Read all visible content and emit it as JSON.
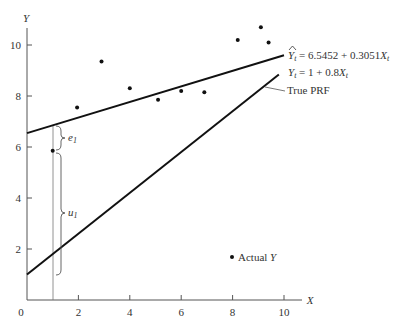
{
  "chart_data": {
    "type": "scatter",
    "title": "",
    "xlabel": "X",
    "ylabel": "Y",
    "xlim": [
      0,
      10.8
    ],
    "ylim": [
      0,
      11
    ],
    "x_ticks": [
      0,
      2,
      4,
      6,
      8,
      10
    ],
    "y_ticks": [
      2,
      4,
      6,
      8,
      10
    ],
    "x_tick_labels": [
      "0",
      "2",
      "4",
      "6",
      "8",
      "10"
    ],
    "y_tick_labels": [
      "2",
      "4",
      "6",
      "8",
      "10"
    ],
    "grid": false,
    "series": [
      {
        "name": "Actual Y",
        "kind": "scatter",
        "points": [
          {
            "x": 1.0,
            "y": 5.85
          },
          {
            "x": 1.95,
            "y": 7.55
          },
          {
            "x": 2.9,
            "y": 9.35
          },
          {
            "x": 4.0,
            "y": 8.3
          },
          {
            "x": 5.1,
            "y": 7.85
          },
          {
            "x": 6.0,
            "y": 8.2
          },
          {
            "x": 6.9,
            "y": 8.15
          },
          {
            "x": 8.2,
            "y": 10.2
          },
          {
            "x": 9.1,
            "y": 10.7
          },
          {
            "x": 9.4,
            "y": 10.1
          }
        ]
      },
      {
        "name": "SRF",
        "kind": "line",
        "intercept": 6.5452,
        "slope": 0.3051,
        "x_range": [
          0,
          10
        ],
        "label": "Ŷt = 6.5452 + 0.3051Xt"
      },
      {
        "name": "True PRF",
        "kind": "line",
        "intercept": 1,
        "slope": 0.8,
        "x_range": [
          0,
          9.8
        ],
        "label": "Yt = 1 + 0.8Xt"
      }
    ],
    "annotations": [
      {
        "text": "e1",
        "type": "brace",
        "x": 1,
        "from_y": 6.85,
        "to_y": 5.9
      },
      {
        "text": "u1",
        "type": "brace",
        "x": 1,
        "from_y": 5.8,
        "to_y": 1.8
      },
      {
        "text": "True PRF",
        "type": "pointer",
        "target_line": "True PRF"
      },
      {
        "text": "Actual Y",
        "type": "legend",
        "marker": "dot"
      }
    ]
  },
  "labels": {
    "y_axis": "Y",
    "x_axis": "X",
    "origin": "0",
    "srf_eq_lhs": "Y",
    "srf_eq_sub": "t",
    "srf_eq_rhs": " = 6.5452 + 0.3051",
    "srf_eq_x": "X",
    "srf_eq_xsub": "t",
    "prf_eq_lhs": "Y",
    "prf_eq_sub": "t",
    "prf_eq_rhs": " = 1 + 0.8",
    "prf_eq_x": "X",
    "prf_eq_xsub": "t",
    "true_prf": "True PRF",
    "e1": "e",
    "e1_sub": "1",
    "u1": "u",
    "u1_sub": "1",
    "legend_actual": "Actual ",
    "legend_actual_y": "Y"
  }
}
